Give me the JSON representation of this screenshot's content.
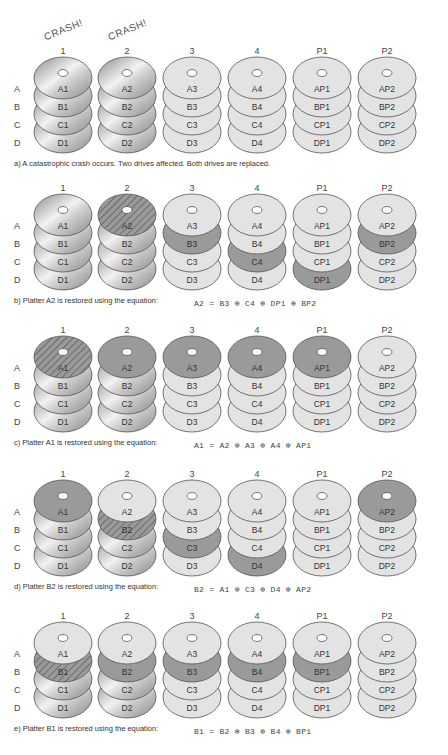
{
  "columns": [
    "1",
    "2",
    "3",
    "4",
    "P1",
    "P2"
  ],
  "rows": [
    "A",
    "B",
    "C",
    "D"
  ],
  "crash_label": "CRASH!",
  "platter_labels": [
    [
      "A1",
      "B1",
      "C1",
      "D1"
    ],
    [
      "A2",
      "B2",
      "C2",
      "D2"
    ],
    [
      "A3",
      "B3",
      "C3",
      "D3"
    ],
    [
      "A4",
      "B4",
      "C4",
      "D4"
    ],
    [
      "AP1",
      "BP1",
      "CP1",
      "DP1"
    ],
    [
      "AP2",
      "BP2",
      "CP2",
      "DP2"
    ]
  ],
  "colors": {
    "light": "#e3e3e3",
    "dark": "#9a9a9a",
    "metal_light": "#f2f2f2",
    "metal_dark": "#8a8a8a",
    "outline": "#555555",
    "hatch": "#6a6a6a"
  },
  "panels": [
    {
      "id": "a",
      "caption": "a) A catastrophic crash occurs. Two drives affected. Both drives are replaced.",
      "equation": "",
      "crash_columns": [
        0,
        1
      ],
      "states": [
        [
          "m",
          "m",
          "m",
          "m"
        ],
        [
          "m",
          "m",
          "m",
          "m"
        ],
        [
          "l",
          "l",
          "l",
          "l"
        ],
        [
          "l",
          "l",
          "l",
          "l"
        ],
        [
          "l",
          "l",
          "l",
          "l"
        ],
        [
          "l",
          "l",
          "l",
          "l"
        ]
      ]
    },
    {
      "id": "b",
      "caption": "b) Platter A2 is restored using the equation:",
      "equation": "A2 = B3 ⊕ C4 ⊕ DP1 ⊕ BP2",
      "crash_columns": [],
      "states": [
        [
          "m",
          "m",
          "m",
          "m"
        ],
        [
          "h",
          "m",
          "m",
          "m"
        ],
        [
          "l",
          "d",
          "l",
          "l"
        ],
        [
          "l",
          "l",
          "d",
          "l"
        ],
        [
          "l",
          "l",
          "l",
          "d"
        ],
        [
          "l",
          "d",
          "l",
          "l"
        ]
      ]
    },
    {
      "id": "c",
      "caption": "c) Platter A1 is restored using the equation:",
      "equation": "A1 = A2 ⊕ A3 ⊕ A4 ⊕ AP1",
      "crash_columns": [],
      "states": [
        [
          "h",
          "m",
          "m",
          "m"
        ],
        [
          "d",
          "m",
          "m",
          "m"
        ],
        [
          "d",
          "l",
          "l",
          "l"
        ],
        [
          "d",
          "l",
          "l",
          "l"
        ],
        [
          "d",
          "l",
          "l",
          "l"
        ],
        [
          "l",
          "l",
          "l",
          "l"
        ]
      ]
    },
    {
      "id": "d",
      "caption": "d) Platter B2 is restored using the equation:",
      "equation": "B2 = A1 ⊕ C3 ⊕ D4 ⊕ AP2",
      "crash_columns": [],
      "states": [
        [
          "d",
          "m",
          "m",
          "m"
        ],
        [
          "l",
          "h",
          "m",
          "m"
        ],
        [
          "l",
          "l",
          "d",
          "l"
        ],
        [
          "l",
          "l",
          "l",
          "d"
        ],
        [
          "l",
          "l",
          "l",
          "l"
        ],
        [
          "d",
          "l",
          "l",
          "l"
        ]
      ]
    },
    {
      "id": "e",
      "caption": "e) Platter B1 is restored using the equation:",
      "equation": "B1 = B2 ⊕ B3 ⊕ B4 ⊕ BP1",
      "crash_columns": [],
      "states": [
        [
          "l",
          "h",
          "m",
          "m"
        ],
        [
          "l",
          "d",
          "m",
          "m"
        ],
        [
          "l",
          "d",
          "l",
          "l"
        ],
        [
          "l",
          "d",
          "l",
          "l"
        ],
        [
          "l",
          "d",
          "l",
          "l"
        ],
        [
          "l",
          "l",
          "l",
          "l"
        ]
      ]
    }
  ]
}
